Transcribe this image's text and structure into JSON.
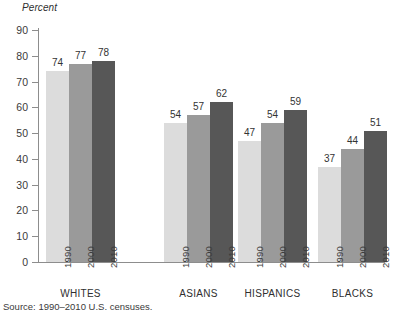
{
  "figure": {
    "y_axis_title": "Percent",
    "source_note": "Source: 1990–2010 U.S. censuses."
  },
  "chart_data": {
    "type": "bar",
    "title": "",
    "subtitle": "",
    "xlabel": "",
    "ylabel": "Percent",
    "ylim": [
      0,
      90
    ],
    "ytick_step": 10,
    "yticks": [
      90,
      80,
      70,
      60,
      50,
      40,
      30,
      20,
      10,
      0
    ],
    "ytick_labels": [
      "90",
      "80",
      "70",
      "60",
      "50",
      "40",
      "30",
      "20",
      "10",
      "0"
    ],
    "grid": false,
    "legend": "none",
    "categories": [
      "WHITES",
      "ASIANS",
      "HISPANICS",
      "BLACKS"
    ],
    "subcategories": [
      "1990",
      "2000",
      "2010"
    ],
    "series": [
      {
        "name": "1990",
        "color": "#dcdcdc",
        "values": [
          74,
          54,
          47,
          37
        ]
      },
      {
        "name": "2000",
        "color": "#9a9a9a",
        "values": [
          77,
          57,
          54,
          44
        ]
      },
      {
        "name": "2010",
        "color": "#575757",
        "values": [
          78,
          62,
          59,
          51
        ]
      }
    ],
    "groups": [
      {
        "label": "WHITES",
        "bars": [
          {
            "year": "1990",
            "value": 74,
            "label": "74",
            "color": "#dcdcdc"
          },
          {
            "year": "2000",
            "value": 77,
            "label": "77",
            "color": "#9a9a9a"
          },
          {
            "year": "2010",
            "value": 78,
            "label": "78",
            "color": "#575757"
          }
        ]
      },
      {
        "label": "ASIANS",
        "bars": [
          {
            "year": "1990",
            "value": 54,
            "label": "54",
            "color": "#dcdcdc"
          },
          {
            "year": "2000",
            "value": 57,
            "label": "57",
            "color": "#9a9a9a"
          },
          {
            "year": "2010",
            "value": 62,
            "label": "62",
            "color": "#575757"
          }
        ]
      },
      {
        "label": "HISPANICS",
        "bars": [
          {
            "year": "1990",
            "value": 47,
            "label": "47",
            "color": "#dcdcdc"
          },
          {
            "year": "2000",
            "value": 54,
            "label": "54",
            "color": "#9a9a9a"
          },
          {
            "year": "2010",
            "value": 59,
            "label": "59",
            "color": "#575757"
          }
        ]
      },
      {
        "label": "BLACKS",
        "bars": [
          {
            "year": "1990",
            "value": 37,
            "label": "37",
            "color": "#dcdcdc"
          },
          {
            "year": "2000",
            "value": 44,
            "label": "44",
            "color": "#9a9a9a"
          },
          {
            "year": "2010",
            "value": 51,
            "label": "51",
            "color": "#575757"
          }
        ]
      }
    ]
  }
}
